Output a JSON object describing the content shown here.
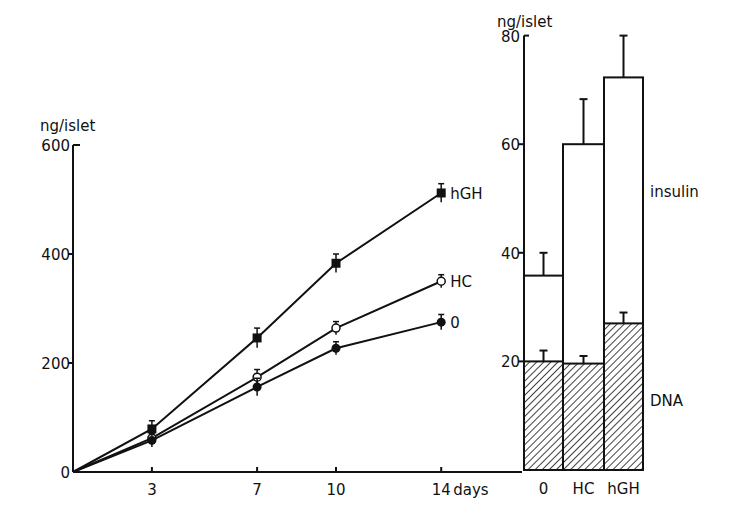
{
  "chart_data": [
    {
      "type": "line",
      "title": "",
      "xlabel": "days",
      "ylabel": "ng/islet",
      "x": [
        0,
        3,
        7,
        10,
        14
      ],
      "xticks": [
        "3",
        "7",
        "10",
        "14"
      ],
      "yticks": [
        "0",
        "200",
        "400",
        "600"
      ],
      "ylim": [
        0,
        600
      ],
      "xlim": [
        0,
        17.5
      ],
      "grid": false,
      "legend_position": "inline-right",
      "series": [
        {
          "name": "hGH",
          "marker": "filled-square",
          "values": [
            0,
            79,
            246,
            383,
            512
          ],
          "err": [
            0,
            15,
            18,
            17,
            17
          ]
        },
        {
          "name": "HC",
          "marker": "open-circle",
          "values": [
            0,
            62,
            174,
            264,
            350
          ],
          "err": [
            0,
            10,
            14,
            12,
            12
          ]
        },
        {
          "name": "0",
          "marker": "filled-circle",
          "values": [
            0,
            58,
            156,
            227,
            275
          ],
          "err": [
            0,
            12,
            16,
            12,
            14
          ]
        }
      ]
    },
    {
      "type": "bar",
      "stacked": true,
      "title": "",
      "xlabel": "",
      "ylabel": "ng/islet",
      "categories": [
        "0",
        "HC",
        "hGH"
      ],
      "yticks": [
        "20",
        "40",
        "60",
        "80"
      ],
      "ylim": [
        0,
        80
      ],
      "grid": false,
      "series": [
        {
          "name": "DNA",
          "pattern": "hatched",
          "values": [
            20,
            19.6,
            27
          ],
          "err": [
            2,
            1.4,
            2
          ]
        },
        {
          "name": "insulin",
          "pattern": "open",
          "values": [
            35.8,
            60,
            72.3
          ],
          "err": [
            4.2,
            8.3,
            7.7
          ],
          "note": "values are bar top totals"
        }
      ],
      "annotations": [
        "insulin",
        "DNA"
      ]
    }
  ],
  "labels": {
    "left_ylabel": "ng/islet",
    "right_ylabel": "ng/islet",
    "xunit": "days",
    "insulin": "insulin",
    "dna": "DNA"
  }
}
